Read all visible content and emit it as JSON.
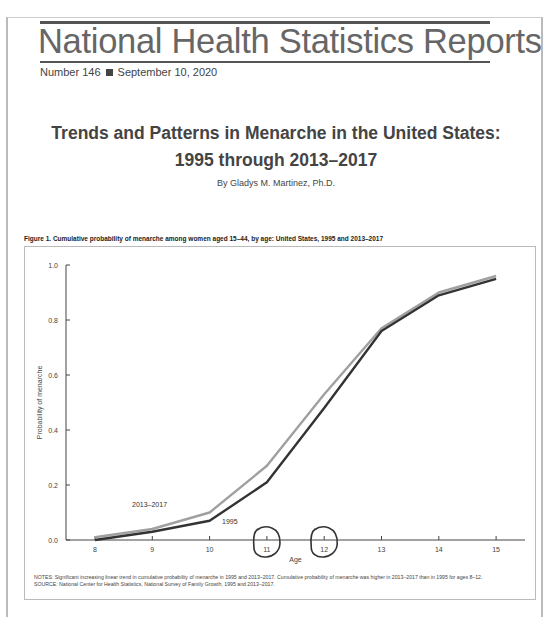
{
  "header": {
    "masthead": "National Health Statistics Reports",
    "number": "Number 146",
    "date": "September 10, 2020"
  },
  "report": {
    "title_line1": "Trends and Patterns in Menarche in the United States:",
    "title_line2": "1995 through 2013–2017",
    "author": "By Gladys M. Martinez, Ph.D."
  },
  "figure": {
    "caption": "Figure 1. Cumulative probability of menarche among women aged 15–44, by age: United States, 1995 and 2013–2017",
    "notes": "NOTES: Significant increasing linear trend in cumulative probability of menarche in 1995 and 2013–2017. Cumulative probability of menarche was higher in 2013–2017 than in 1995 for ages 8–12.",
    "source": "SOURCE: National Center for Health Statistics, National Survey of Family Growth, 1995 and 2013–2017."
  },
  "chart_data": {
    "type": "line",
    "title": "Cumulative probability of menarche among women aged 15–44, by age: United States, 1995 and 2013–2017",
    "xlabel": "Age",
    "ylabel": "Probability of menarche",
    "x": [
      8,
      9,
      10,
      11,
      12,
      13,
      14,
      15
    ],
    "x_tick_labels": [
      "8",
      "9",
      "10",
      "11",
      "12",
      "13",
      "14",
      "15"
    ],
    "y_tick_labels": [
      "0.0",
      "0.2",
      "0.4",
      "0.6",
      "0.8",
      "1.0"
    ],
    "ylim": [
      0,
      1.0
    ],
    "grid": false,
    "legend": "inline labels near lines",
    "series": [
      {
        "name": "2013–2017",
        "color": "#a0a0a0",
        "values": [
          0.01,
          0.04,
          0.1,
          0.27,
          0.53,
          0.77,
          0.9,
          0.96
        ]
      },
      {
        "name": "1995",
        "color": "#333333",
        "values": [
          0.0,
          0.03,
          0.07,
          0.21,
          0.48,
          0.76,
          0.89,
          0.95
        ]
      }
    ],
    "annotations": [
      "Hand-drawn circles around x tick labels 11 and 12"
    ]
  }
}
